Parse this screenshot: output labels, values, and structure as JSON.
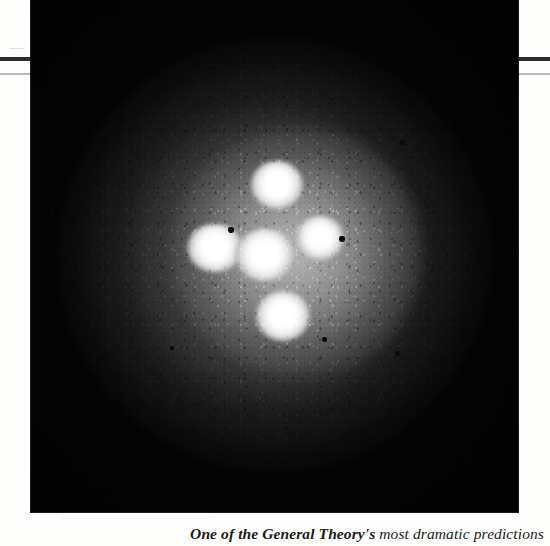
{
  "page": {
    "background_color": "#fdfdfb",
    "rules": [
      {
        "name": "thick-rule",
        "color": "#2c2c2c",
        "thickness_px": 4,
        "y_px": 57
      },
      {
        "name": "thin-rule",
        "color": "#b9b9b9",
        "thickness_px": 2,
        "y_px": 73
      }
    ]
  },
  "figure": {
    "alt": "Astronomical photograph of the Einstein Cross gravitational lens: four bright quasar images arranged around a central lensing galaxy, embedded in a grainy diffuse halo on a black sky background.",
    "frame": {
      "x_px": 31,
      "y_px": 0,
      "width_px": 487,
      "height_px": 512
    },
    "background_color": "#050505",
    "halo_color": "#8a8a8a",
    "knot_color": "#ffffff",
    "knots": [
      {
        "name": "lensed-image-top",
        "cx_px": 246,
        "cy_px": 185,
        "rx_px": 26,
        "ry_px": 24
      },
      {
        "name": "lensed-image-left",
        "cx_px": 184,
        "cy_px": 248,
        "rx_px": 28,
        "ry_px": 24
      },
      {
        "name": "galaxy-core-center",
        "cx_px": 234,
        "cy_px": 255,
        "rx_px": 30,
        "ry_px": 26
      },
      {
        "name": "lensed-image-right",
        "cx_px": 289,
        "cy_px": 238,
        "rx_px": 24,
        "ry_px": 22
      },
      {
        "name": "lensed-image-bottom",
        "cx_px": 252,
        "cy_px": 316,
        "rx_px": 27,
        "ry_px": 25
      }
    ],
    "specks": [
      {
        "cx_px": 200,
        "cy_px": 230,
        "size_px": 6
      },
      {
        "cx_px": 311,
        "cy_px": 239,
        "size_px": 6
      },
      {
        "cx_px": 293,
        "cy_px": 339,
        "size_px": 5
      },
      {
        "cx_px": 371,
        "cy_px": 142,
        "size_px": 5
      },
      {
        "cx_px": 141,
        "cy_px": 348,
        "size_px": 4
      },
      {
        "cx_px": 366,
        "cy_px": 353,
        "size_px": 5
      }
    ]
  },
  "caption": {
    "lead": "One of the General Theory's",
    "rest": " most dramatic predictions",
    "full": "One of the General Theory's most dramatic predictions"
  }
}
